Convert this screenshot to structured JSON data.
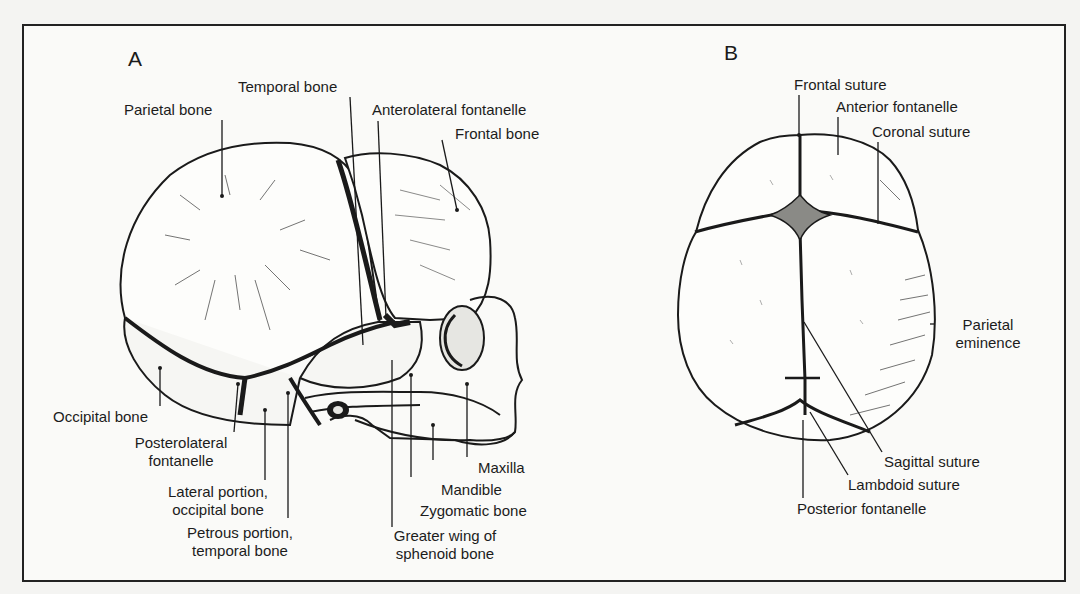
{
  "figure": {
    "panels": [
      {
        "letter": "A",
        "view": "lateral",
        "labels": {
          "parietal_bone": "Parietal bone",
          "temporal_bone": "Temporal bone",
          "anterolateral_fontanelle": "Anterolateral fontanelle",
          "frontal_bone": "Frontal bone",
          "occipital_bone": "Occipital bone",
          "posterolateral_fontanelle_1": "Posterolateral",
          "posterolateral_fontanelle_2": "fontanelle",
          "lateral_portion_1": "Lateral portion,",
          "lateral_portion_2": "occipital bone",
          "petrous_portion_1": "Petrous portion,",
          "petrous_portion_2": "temporal bone",
          "maxilla": "Maxilla",
          "mandible": "Mandible",
          "zygomatic_bone": "Zygomatic bone",
          "greater_wing_1": "Greater wing of",
          "greater_wing_2": "sphenoid bone"
        }
      },
      {
        "letter": "B",
        "view": "superior",
        "labels": {
          "frontal_suture": "Frontal suture",
          "anterior_fontanelle": "Anterior fontanelle",
          "coronal_suture": "Coronal suture",
          "parietal_eminence_1": "Parietal",
          "parietal_eminence_2": "eminence",
          "sagittal_suture": "Sagittal suture",
          "lambdoid_suture": "Lambdoid suture",
          "posterior_fontanelle": "Posterior fontanelle"
        }
      }
    ],
    "colors": {
      "ink": "#1a1a1a",
      "paper": "#fafaf8",
      "background": "#f4f4f2"
    }
  }
}
